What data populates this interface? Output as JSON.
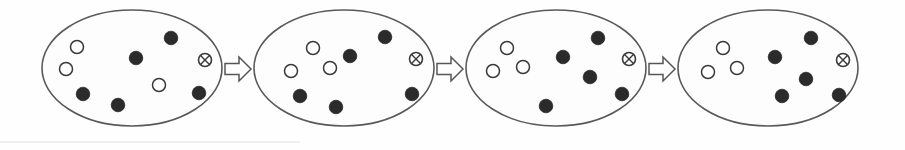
{
  "figure": {
    "canvas": {
      "width": 905,
      "height": 150
    },
    "background_color": "#fefefe",
    "outline_color": "#595959",
    "filled_marker_color": "#2b2b2b",
    "open_marker_color": "#ffffff",
    "marker_stroke_color": "#3a3a3a",
    "arrow_fill_color": "#ffffff",
    "arrow_stroke_color": "#575757"
  },
  "legend_semantics": {
    "filled_dot": "filled-dot",
    "open_dot": "open-dot",
    "crossed_circle": "crossed-circle"
  },
  "sets": [
    {
      "id": "set-1",
      "label": "Set 1",
      "ellipse": {
        "cx": 132,
        "cy": 68,
        "rx": 90,
        "ry": 58
      },
      "counts": {
        "filled": 5,
        "open": 3,
        "crossed": 1,
        "total": 9
      },
      "markers": [
        {
          "type": "open",
          "cx": 77,
          "cy": 47,
          "r": 6.5
        },
        {
          "type": "open",
          "cx": 66,
          "cy": 69,
          "r": 6.5
        },
        {
          "type": "filled",
          "cx": 83,
          "cy": 94,
          "r": 6.8
        },
        {
          "type": "filled",
          "cx": 118,
          "cy": 105,
          "r": 6.8
        },
        {
          "type": "filled",
          "cx": 136,
          "cy": 58,
          "r": 6.8
        },
        {
          "type": "filled",
          "cx": 171,
          "cy": 38,
          "r": 6.8
        },
        {
          "type": "open",
          "cx": 159,
          "cy": 85,
          "r": 6.5
        },
        {
          "type": "crossed",
          "cx": 205,
          "cy": 60,
          "r": 6.5
        },
        {
          "type": "filled",
          "cx": 199,
          "cy": 93,
          "r": 6.8
        }
      ]
    },
    {
      "id": "set-2",
      "label": "Set 2",
      "ellipse": {
        "cx": 344,
        "cy": 68,
        "rx": 90,
        "ry": 58
      },
      "counts": {
        "filled": 5,
        "open": 3,
        "crossed": 1,
        "total": 9
      },
      "markers": [
        {
          "type": "open",
          "cx": 313,
          "cy": 48,
          "r": 6.5
        },
        {
          "type": "open",
          "cx": 291,
          "cy": 71,
          "r": 6.5
        },
        {
          "type": "open",
          "cx": 330,
          "cy": 68,
          "r": 6.5
        },
        {
          "type": "filled",
          "cx": 350,
          "cy": 56,
          "r": 6.8
        },
        {
          "type": "filled",
          "cx": 385,
          "cy": 37,
          "r": 6.8
        },
        {
          "type": "crossed",
          "cx": 416,
          "cy": 59,
          "r": 6.5
        },
        {
          "type": "filled",
          "cx": 300,
          "cy": 96,
          "r": 6.8
        },
        {
          "type": "filled",
          "cx": 336,
          "cy": 107,
          "r": 6.8
        },
        {
          "type": "filled",
          "cx": 412,
          "cy": 94,
          "r": 6.8
        }
      ]
    },
    {
      "id": "set-3",
      "label": "Set 3",
      "ellipse": {
        "cx": 556,
        "cy": 68,
        "rx": 90,
        "ry": 58
      },
      "counts": {
        "filled": 6,
        "open": 3,
        "crossed": 1,
        "total": 10
      },
      "markers": [
        {
          "type": "open",
          "cx": 507,
          "cy": 48,
          "r": 6.5
        },
        {
          "type": "open",
          "cx": 493,
          "cy": 71,
          "r": 6.5
        },
        {
          "type": "open",
          "cx": 523,
          "cy": 67,
          "r": 6.5
        },
        {
          "type": "filled",
          "cx": 563,
          "cy": 57,
          "r": 6.8
        },
        {
          "type": "filled",
          "cx": 598,
          "cy": 38,
          "r": 6.8
        },
        {
          "type": "crossed",
          "cx": 629,
          "cy": 59,
          "r": 6.5
        },
        {
          "type": "filled",
          "cx": 590,
          "cy": 77,
          "r": 6.8
        },
        {
          "type": "filled",
          "cx": 622,
          "cy": 94,
          "r": 6.8
        },
        {
          "type": "filled",
          "cx": 546,
          "cy": 106,
          "r": 6.8
        }
      ]
    },
    {
      "id": "set-4",
      "label": "Set 4",
      "ellipse": {
        "cx": 768,
        "cy": 68,
        "rx": 90,
        "ry": 58
      },
      "counts": {
        "filled": 6,
        "open": 3,
        "crossed": 1,
        "total": 10
      },
      "markers": [
        {
          "type": "open",
          "cx": 723,
          "cy": 48,
          "r": 6.5
        },
        {
          "type": "open",
          "cx": 708,
          "cy": 72,
          "r": 6.5
        },
        {
          "type": "open",
          "cx": 737,
          "cy": 68,
          "r": 6.5
        },
        {
          "type": "filled",
          "cx": 775,
          "cy": 57,
          "r": 6.8
        },
        {
          "type": "filled",
          "cx": 811,
          "cy": 38,
          "r": 6.8
        },
        {
          "type": "crossed",
          "cx": 843,
          "cy": 60,
          "r": 6.5
        },
        {
          "type": "filled",
          "cx": 806,
          "cy": 79,
          "r": 6.8
        },
        {
          "type": "filled",
          "cx": 839,
          "cy": 95,
          "r": 6.8
        },
        {
          "type": "filled",
          "cx": 782,
          "cy": 96,
          "r": 6.8
        }
      ]
    }
  ],
  "arrows": [
    {
      "id": "arrow-1",
      "label": "Step 1 to 2",
      "cx": 238,
      "cy": 69
    },
    {
      "id": "arrow-2",
      "label": "Step 2 to 3",
      "cx": 450,
      "cy": 69
    },
    {
      "id": "arrow-3",
      "label": "Step 3 to 4",
      "cx": 662,
      "cy": 69
    }
  ],
  "scan_artifacts": {
    "bottom_rule": {
      "x1": 0,
      "y1": 142,
      "x2": 300,
      "y2": 142
    }
  }
}
